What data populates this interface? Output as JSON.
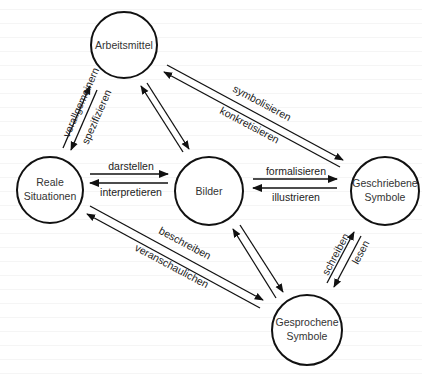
{
  "diagram": {
    "nodes": {
      "arbeitsmittel": {
        "label": "Arbeitsmittel"
      },
      "reale": {
        "line1": "Reale",
        "line2": "Situationen"
      },
      "bilder": {
        "label": "Bilder"
      },
      "geschrieben": {
        "line1": "Geschriebene",
        "line2": "Symbole"
      },
      "gesprochen": {
        "line1": "Gesprochene",
        "line2": "Symbole"
      }
    },
    "edges": {
      "reale_arbeitsmittel": {
        "up": "verallgemeinern",
        "down": "spezifizieren"
      },
      "arbeitsmittel_geschrieben": {
        "forward": "symbolisieren",
        "back": "konkretisieren"
      },
      "reale_bilder": {
        "forward": "darstellen",
        "back": "interpretieren"
      },
      "bilder_geschrieben": {
        "forward": "formalisieren",
        "back": "illustrieren"
      },
      "reale_gesprochen": {
        "forward": "beschreiben",
        "back": "veranschaulichen"
      },
      "gesprochen_geschrieben": {
        "up": "schreiben",
        "down": "lesen"
      }
    },
    "colors": {
      "stroke": "#111111",
      "text": "#333333",
      "background": "#ffffff"
    }
  }
}
